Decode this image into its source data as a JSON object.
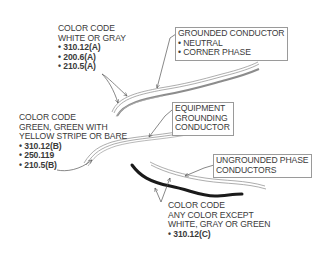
{
  "diagram": {
    "type": "conductor-color-code-illustration",
    "labels": {
      "grounded_color": {
        "title": [
          "COLOR CODE",
          "WHITE OR GRAY"
        ],
        "refs": [
          "• 310.12(A)",
          "• 200.6(A)",
          "• 210.5(A)"
        ]
      },
      "grounding_color": {
        "title": [
          "COLOR CODE",
          "GREEN, GREEN WITH",
          "YELLOW STRIPE OR BARE"
        ],
        "refs": [
          "• 310.12(B)",
          "• 250.119",
          "• 210.5(B)"
        ]
      },
      "ungrounded_color": {
        "title": [
          "COLOR CODE",
          "ANY COLOR EXCEPT",
          "WHITE, GRAY OR GREEN"
        ],
        "refs": [
          "• 310.12(C)"
        ]
      }
    },
    "callouts": {
      "grounded": [
        "GROUNDED CONDUCTOR",
        "• NEUTRAL",
        "• CORNER PHASE"
      ],
      "equipment": [
        "EQUIPMENT",
        "GROUNDING",
        "CONDUCTOR"
      ],
      "ungrounded": [
        "UNGROUNDED PHASE",
        "CONDUCTORS"
      ]
    },
    "colors": {
      "line": "#555555",
      "thin_wire": "#8a8a8a",
      "gray_wire": "#8c8c8c",
      "black_wire": "#1a1a1a",
      "box_border": "#9a9a9a",
      "text": "#3a3a3a"
    }
  }
}
